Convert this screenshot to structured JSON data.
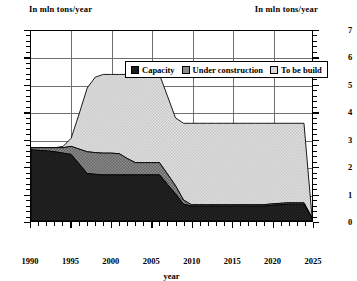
{
  "header": {
    "left_unit": "In mln tons/year",
    "right_unit": "In mln tons/year"
  },
  "legend": {
    "items": [
      {
        "label": "Capacity",
        "color": "#1c1c1c",
        "pattern": "solid-black"
      },
      {
        "label": "Under construction",
        "color": "#8a8a8a",
        "pattern": "dense-dots"
      },
      {
        "label": "To be build",
        "color": "#d8d8d8",
        "pattern": "sparse-dots"
      }
    ]
  },
  "axes": {
    "y_ticks": [
      "0",
      "1",
      "2",
      "3",
      "4",
      "5",
      "6",
      "7"
    ],
    "x_ticks": [
      "1990",
      "1995",
      "2000",
      "2005",
      "2010",
      "2015",
      "2020",
      "2025"
    ],
    "x_title": "year"
  },
  "chart_data": {
    "type": "area",
    "stacked": true,
    "title": "",
    "subtitle": "",
    "xlabel": "year",
    "ylabel": "In mln tons/year",
    "y2label": "In mln tons/year",
    "xlim": [
      1990,
      2025
    ],
    "ylim": [
      0,
      7
    ],
    "ytick_step": 1,
    "xtick_step": 5,
    "x_minor_step": 1,
    "grid": "horizontal",
    "legend_position": "top-center-inside",
    "x": [
      1990,
      1991,
      1992,
      1993,
      1994,
      1995,
      1996,
      1997,
      1998,
      1999,
      2000,
      2001,
      2002,
      2003,
      2004,
      2005,
      2006,
      2007,
      2008,
      2009,
      2010,
      2011,
      2012,
      2013,
      2014,
      2015,
      2016,
      2017,
      2018,
      2019,
      2020,
      2021,
      2022,
      2023,
      2024,
      2025
    ],
    "series": [
      {
        "name": "Capacity",
        "color": "#1c1c1c",
        "values": [
          2.62,
          2.6,
          2.58,
          2.55,
          2.5,
          2.45,
          2.1,
          1.75,
          1.72,
          1.7,
          1.7,
          1.7,
          1.7,
          1.7,
          1.7,
          1.7,
          1.7,
          1.35,
          1.0,
          0.62,
          0.55,
          0.55,
          0.55,
          0.55,
          0.55,
          0.55,
          0.55,
          0.55,
          0.55,
          0.55,
          0.58,
          0.6,
          0.62,
          0.62,
          0.62,
          0.1
        ]
      },
      {
        "name": "Under construction",
        "color": "#8a8a8a",
        "values": [
          0.08,
          0.1,
          0.12,
          0.15,
          0.2,
          0.3,
          0.55,
          0.8,
          0.8,
          0.8,
          0.8,
          0.78,
          0.6,
          0.45,
          0.45,
          0.45,
          0.45,
          0.38,
          0.3,
          0.15,
          0.05,
          0.05,
          0.05,
          0.05,
          0.05,
          0.05,
          0.05,
          0.05,
          0.05,
          0.05,
          0.05,
          0.05,
          0.05,
          0.05,
          0.05,
          0.03
        ]
      },
      {
        "name": "To be build",
        "color": "#d8d8d8",
        "values": [
          0.0,
          0.0,
          0.0,
          0.0,
          0.05,
          0.3,
          1.3,
          2.35,
          2.78,
          2.9,
          2.9,
          2.92,
          3.1,
          3.25,
          3.25,
          3.25,
          3.25,
          2.87,
          2.5,
          2.83,
          3.0,
          3.0,
          3.0,
          3.0,
          3.0,
          3.0,
          3.0,
          3.0,
          3.0,
          3.0,
          2.97,
          2.95,
          2.93,
          2.93,
          2.93,
          0.02
        ]
      }
    ],
    "totals": [
      2.7,
      2.7,
      2.7,
      2.7,
      2.75,
      3.05,
      3.95,
      4.9,
      5.3,
      5.4,
      5.4,
      5.4,
      5.4,
      5.4,
      5.4,
      5.4,
      5.4,
      4.6,
      3.8,
      3.6,
      3.6,
      3.6,
      3.6,
      3.6,
      3.6,
      3.6,
      3.6,
      3.6,
      3.6,
      3.6,
      3.6,
      3.6,
      3.6,
      3.6,
      3.6,
      0.15
    ]
  }
}
